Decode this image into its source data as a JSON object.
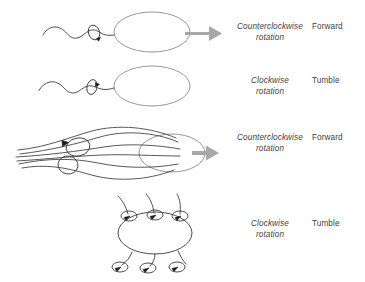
{
  "figure": {
    "background_color": "#ffffff",
    "ink_color": "#3a3a3a",
    "arrow_color": "#a8a8a8",
    "cell_outline_color": "#8a8a8a",
    "rows": [
      {
        "id": "monotrichous-ccw",
        "cell_type": "monotrichous-single-polar-flagellum",
        "flagella_count": 1,
        "flagella_state": "bundled-helical-wave",
        "rotation_label": "Counterclockwise\nrotation",
        "rotation_line_1": "Counterclockwise",
        "rotation_line_2": "rotation",
        "outcome_label": "Forward",
        "motion_arrow": true
      },
      {
        "id": "monotrichous-cw",
        "cell_type": "monotrichous-single-polar-flagellum",
        "flagella_count": 1,
        "flagella_state": "reversed-wave",
        "rotation_label": "Clockwise\nrotation",
        "rotation_line_1": "Clockwise",
        "rotation_line_2": "rotation",
        "outcome_label": "Tumble",
        "motion_arrow": false
      },
      {
        "id": "peritrichous-ccw",
        "cell_type": "peritrichous-multiple-flagella",
        "flagella_count": 6,
        "flagella_state": "bundled-together",
        "rotation_label": "Counterclockwise\nrotation",
        "rotation_line_1": "Counterclockwise",
        "rotation_line_2": "rotation",
        "outcome_label": "Forward",
        "motion_arrow": true
      },
      {
        "id": "peritrichous-cw",
        "cell_type": "peritrichous-multiple-flagella",
        "flagella_count": 6,
        "flagella_state": "splayed-apart",
        "rotation_label": "Clockwise\nrotation",
        "rotation_line_1": "Clockwise",
        "rotation_line_2": "rotation",
        "outcome_label": "Tumble",
        "motion_arrow": false
      }
    ]
  }
}
